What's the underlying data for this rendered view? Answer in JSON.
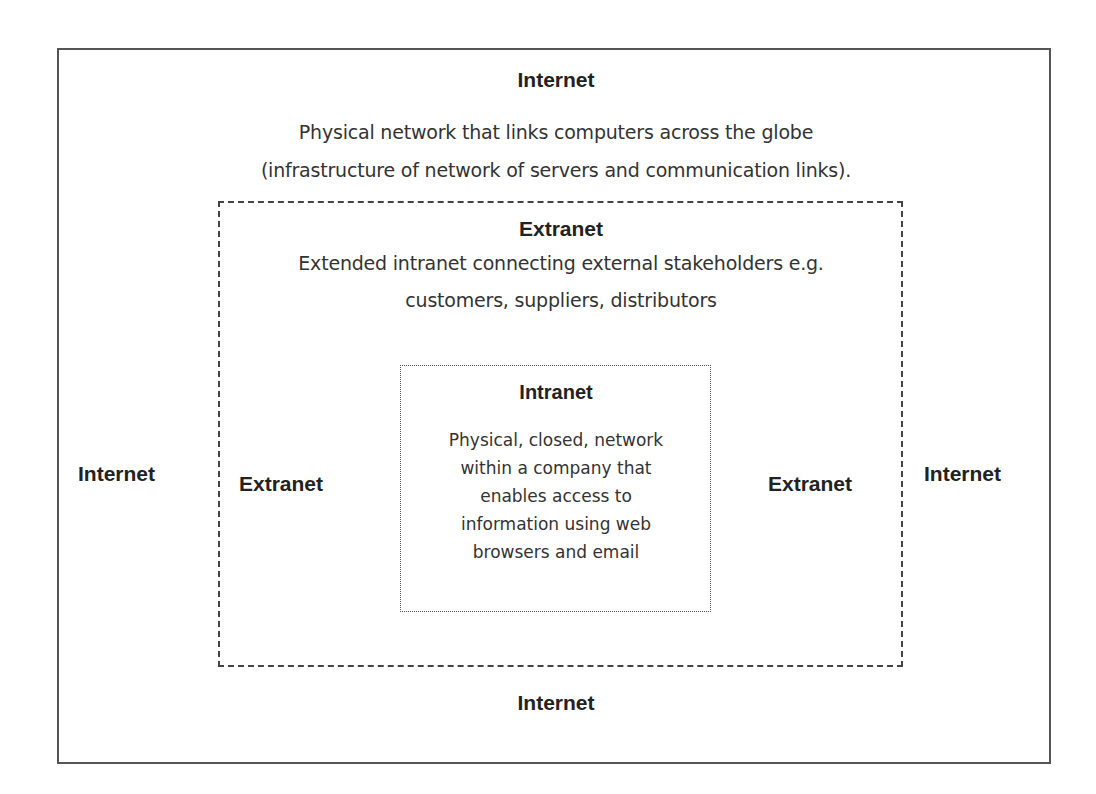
{
  "diagram": {
    "internet": {
      "title_top": "Internet",
      "description_line1": "Physical network that links computers across the globe",
      "description_line2": "(infrastructure of network of servers and communication links).",
      "label_left": "Internet",
      "label_right": "Internet",
      "label_bottom": "Internet"
    },
    "extranet": {
      "title_top": "Extranet",
      "description_line1": "Extended intranet connecting external stakeholders e.g.",
      "description_line2": "customers, suppliers, distributors",
      "label_left": "Extranet",
      "label_right": "Extranet"
    },
    "intranet": {
      "title": "Intranet",
      "description_lines": [
        "Physical, closed, network",
        "within a company that",
        "enables access to",
        "information using web",
        "browsers and email"
      ]
    },
    "colors": {
      "border": "#555555",
      "text": "#222222",
      "background": "#ffffff"
    }
  }
}
